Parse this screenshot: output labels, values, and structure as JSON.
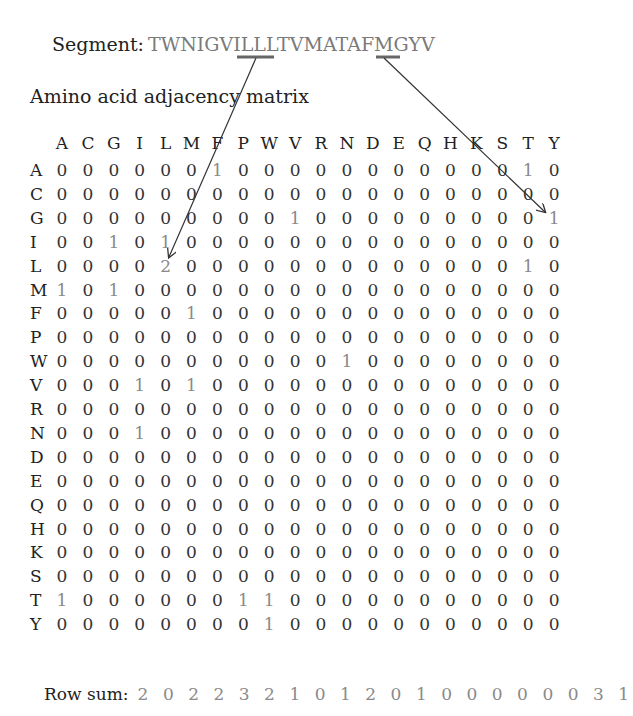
{
  "segment": {
    "label": "Segment:",
    "sequence": "TWNIGVILLLTVMATAFMGYV"
  },
  "title": "Amino acid adjacency matrix",
  "columns": [
    "A",
    "C",
    "G",
    "I",
    "L",
    "M",
    "F",
    "P",
    "W",
    "V",
    "R",
    "N",
    "D",
    "E",
    "Q",
    "H",
    "K",
    "S",
    "T",
    "Y"
  ],
  "rows": [
    {
      "label": "A",
      "values": [
        0,
        0,
        0,
        0,
        0,
        0,
        1,
        0,
        0,
        0,
        0,
        0,
        0,
        0,
        0,
        0,
        0,
        0,
        1,
        0
      ]
    },
    {
      "label": "C",
      "values": [
        0,
        0,
        0,
        0,
        0,
        0,
        0,
        0,
        0,
        0,
        0,
        0,
        0,
        0,
        0,
        0,
        0,
        0,
        0,
        0
      ]
    },
    {
      "label": "G",
      "values": [
        0,
        0,
        0,
        0,
        0,
        0,
        0,
        0,
        0,
        1,
        0,
        0,
        0,
        0,
        0,
        0,
        0,
        0,
        0,
        1
      ]
    },
    {
      "label": "I",
      "values": [
        0,
        0,
        1,
        0,
        1,
        0,
        0,
        0,
        0,
        0,
        0,
        0,
        0,
        0,
        0,
        0,
        0,
        0,
        0,
        0
      ]
    },
    {
      "label": "L",
      "values": [
        0,
        0,
        0,
        0,
        2,
        0,
        0,
        0,
        0,
        0,
        0,
        0,
        0,
        0,
        0,
        0,
        0,
        0,
        1,
        0
      ]
    },
    {
      "label": "M",
      "values": [
        1,
        0,
        1,
        0,
        0,
        0,
        0,
        0,
        0,
        0,
        0,
        0,
        0,
        0,
        0,
        0,
        0,
        0,
        0,
        0
      ]
    },
    {
      "label": "F",
      "values": [
        0,
        0,
        0,
        0,
        0,
        1,
        0,
        0,
        0,
        0,
        0,
        0,
        0,
        0,
        0,
        0,
        0,
        0,
        0,
        0
      ]
    },
    {
      "label": "P",
      "values": [
        0,
        0,
        0,
        0,
        0,
        0,
        0,
        0,
        0,
        0,
        0,
        0,
        0,
        0,
        0,
        0,
        0,
        0,
        0,
        0
      ]
    },
    {
      "label": "W",
      "values": [
        0,
        0,
        0,
        0,
        0,
        0,
        0,
        0,
        0,
        0,
        0,
        1,
        0,
        0,
        0,
        0,
        0,
        0,
        0,
        0
      ]
    },
    {
      "label": "V",
      "values": [
        0,
        0,
        0,
        1,
        0,
        1,
        0,
        0,
        0,
        0,
        0,
        0,
        0,
        0,
        0,
        0,
        0,
        0,
        0,
        0
      ]
    },
    {
      "label": "R",
      "values": [
        0,
        0,
        0,
        0,
        0,
        0,
        0,
        0,
        0,
        0,
        0,
        0,
        0,
        0,
        0,
        0,
        0,
        0,
        0,
        0
      ]
    },
    {
      "label": "N",
      "values": [
        0,
        0,
        0,
        1,
        0,
        0,
        0,
        0,
        0,
        0,
        0,
        0,
        0,
        0,
        0,
        0,
        0,
        0,
        0,
        0
      ]
    },
    {
      "label": "D",
      "values": [
        0,
        0,
        0,
        0,
        0,
        0,
        0,
        0,
        0,
        0,
        0,
        0,
        0,
        0,
        0,
        0,
        0,
        0,
        0,
        0
      ]
    },
    {
      "label": "E",
      "values": [
        0,
        0,
        0,
        0,
        0,
        0,
        0,
        0,
        0,
        0,
        0,
        0,
        0,
        0,
        0,
        0,
        0,
        0,
        0,
        0
      ]
    },
    {
      "label": "Q",
      "values": [
        0,
        0,
        0,
        0,
        0,
        0,
        0,
        0,
        0,
        0,
        0,
        0,
        0,
        0,
        0,
        0,
        0,
        0,
        0,
        0
      ]
    },
    {
      "label": "H",
      "values": [
        0,
        0,
        0,
        0,
        0,
        0,
        0,
        0,
        0,
        0,
        0,
        0,
        0,
        0,
        0,
        0,
        0,
        0,
        0,
        0
      ]
    },
    {
      "label": "K",
      "values": [
        0,
        0,
        0,
        0,
        0,
        0,
        0,
        0,
        0,
        0,
        0,
        0,
        0,
        0,
        0,
        0,
        0,
        0,
        0,
        0
      ]
    },
    {
      "label": "S",
      "values": [
        0,
        0,
        0,
        0,
        0,
        0,
        0,
        0,
        0,
        0,
        0,
        0,
        0,
        0,
        0,
        0,
        0,
        0,
        0,
        0
      ]
    },
    {
      "label": "T",
      "values": [
        1,
        0,
        0,
        0,
        0,
        0,
        0,
        1,
        1,
        0,
        0,
        0,
        0,
        0,
        0,
        0,
        0,
        0,
        0,
        0
      ]
    },
    {
      "label": "Y",
      "values": [
        0,
        0,
        0,
        0,
        0,
        0,
        0,
        0,
        1,
        0,
        0,
        0,
        0,
        0,
        0,
        0,
        0,
        0,
        0,
        0
      ]
    }
  ],
  "row_sum": {
    "label": "Row sum:",
    "values": [
      2,
      0,
      2,
      2,
      3,
      2,
      1,
      0,
      1,
      2,
      0,
      1,
      0,
      0,
      0,
      0,
      0,
      0,
      3,
      1
    ]
  },
  "colors": {
    "text": "#222222",
    "highlight_gray": "#8a8a8a",
    "sequence_gray": "#7a7a7a",
    "arrow": "#333333"
  }
}
